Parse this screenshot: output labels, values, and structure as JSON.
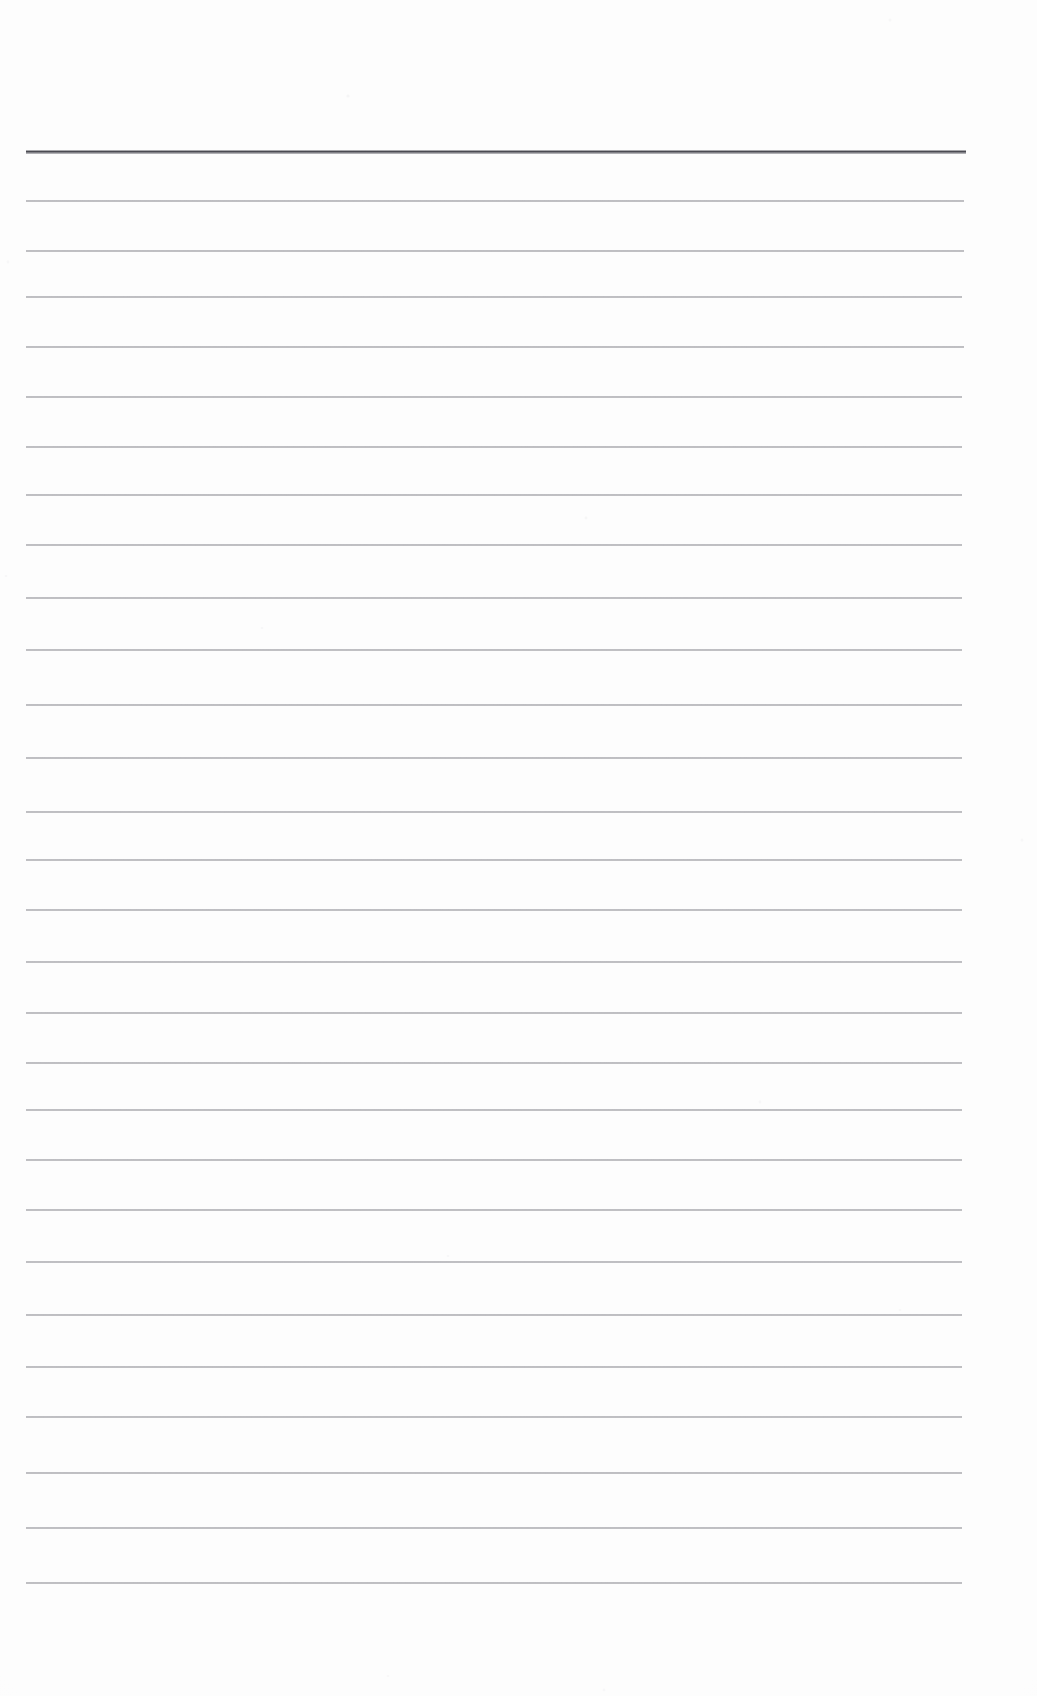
{
  "document": {
    "kind": "scanned-lined-paper",
    "title": "Blank Ruled Notebook Page",
    "page_width": 1037,
    "page_height": 1696,
    "background_color": "#fdfdfd",
    "ink_color": "#6a6a72",
    "header_ink_color": "#3f3f47",
    "text_content": "",
    "ruled_area": {
      "left": 26,
      "right": 964,
      "width": 938,
      "first_line_y": 152,
      "last_line_y": 1583,
      "line_spacing": 53,
      "line_count": 28
    },
    "lines": [
      {
        "index": 1,
        "y": 152,
        "left": 26,
        "right": 966,
        "weight": "header",
        "thickness": 3.2
      },
      {
        "index": 2,
        "y": 201,
        "left": 26,
        "right": 964,
        "weight": "body",
        "thickness": 1.5
      },
      {
        "index": 3,
        "y": 251,
        "left": 26,
        "right": 964,
        "weight": "body",
        "thickness": 1.5
      },
      {
        "index": 4,
        "y": 297,
        "left": 26,
        "right": 962,
        "weight": "body",
        "thickness": 1.5
      },
      {
        "index": 5,
        "y": 347,
        "left": 26,
        "right": 964,
        "weight": "body",
        "thickness": 1.5
      },
      {
        "index": 6,
        "y": 397,
        "left": 26,
        "right": 962,
        "weight": "body",
        "thickness": 1.5
      },
      {
        "index": 7,
        "y": 447,
        "left": 26,
        "right": 962,
        "weight": "body",
        "thickness": 1.5
      },
      {
        "index": 8,
        "y": 495,
        "left": 26,
        "right": 962,
        "weight": "body",
        "thickness": 1.5
      },
      {
        "index": 9,
        "y": 545,
        "left": 26,
        "right": 962,
        "weight": "body",
        "thickness": 1.5
      },
      {
        "index": 10,
        "y": 598,
        "left": 26,
        "right": 962,
        "weight": "body",
        "thickness": 1.5
      },
      {
        "index": 11,
        "y": 650,
        "left": 26,
        "right": 962,
        "weight": "body",
        "thickness": 1.5
      },
      {
        "index": 12,
        "y": 705,
        "left": 26,
        "right": 962,
        "weight": "body",
        "thickness": 1.5
      },
      {
        "index": 13,
        "y": 758,
        "left": 26,
        "right": 962,
        "weight": "body",
        "thickness": 1.5
      },
      {
        "index": 14,
        "y": 812,
        "left": 26,
        "right": 962,
        "weight": "body",
        "thickness": 1.5
      },
      {
        "index": 15,
        "y": 860,
        "left": 26,
        "right": 962,
        "weight": "body",
        "thickness": 1.5
      },
      {
        "index": 16,
        "y": 910,
        "left": 26,
        "right": 962,
        "weight": "body",
        "thickness": 1.5
      },
      {
        "index": 17,
        "y": 962,
        "left": 26,
        "right": 962,
        "weight": "body",
        "thickness": 1.5
      },
      {
        "index": 18,
        "y": 1013,
        "left": 26,
        "right": 962,
        "weight": "body",
        "thickness": 1.5
      },
      {
        "index": 19,
        "y": 1063,
        "left": 26,
        "right": 962,
        "weight": "body",
        "thickness": 1.5
      },
      {
        "index": 20,
        "y": 1110,
        "left": 26,
        "right": 962,
        "weight": "body",
        "thickness": 1.5
      },
      {
        "index": 21,
        "y": 1160,
        "left": 26,
        "right": 962,
        "weight": "body",
        "thickness": 1.5
      },
      {
        "index": 22,
        "y": 1210,
        "left": 26,
        "right": 962,
        "weight": "body",
        "thickness": 1.5
      },
      {
        "index": 23,
        "y": 1262,
        "left": 26,
        "right": 962,
        "weight": "body",
        "thickness": 1.5
      },
      {
        "index": 24,
        "y": 1315,
        "left": 26,
        "right": 962,
        "weight": "body",
        "thickness": 1.5
      },
      {
        "index": 25,
        "y": 1367,
        "left": 26,
        "right": 962,
        "weight": "body",
        "thickness": 1.5
      },
      {
        "index": 26,
        "y": 1417,
        "left": 26,
        "right": 962,
        "weight": "body",
        "thickness": 1.5
      },
      {
        "index": 27,
        "y": 1473,
        "left": 26,
        "right": 962,
        "weight": "body",
        "thickness": 1.5
      },
      {
        "index": 28,
        "y": 1528,
        "left": 26,
        "right": 962,
        "weight": "body",
        "thickness": 1.5
      },
      {
        "index": 29,
        "y": 1583,
        "left": 26,
        "right": 962,
        "weight": "body",
        "thickness": 1.5
      }
    ],
    "speckles": [
      {
        "x": 348,
        "y": 96,
        "r": 1.6,
        "o": 0.16
      },
      {
        "x": 586,
        "y": 518,
        "r": 1.4,
        "o": 0.14
      },
      {
        "x": 262,
        "y": 628,
        "r": 1.3,
        "o": 0.12
      },
      {
        "x": 890,
        "y": 20,
        "r": 1.5,
        "o": 0.13
      },
      {
        "x": 8,
        "y": 262,
        "r": 1.4,
        "o": 0.12
      },
      {
        "x": 6,
        "y": 576,
        "r": 1.3,
        "o": 0.11
      },
      {
        "x": 760,
        "y": 1102,
        "r": 1.4,
        "o": 0.12
      },
      {
        "x": 448,
        "y": 1256,
        "r": 1.3,
        "o": 0.11
      },
      {
        "x": 1022,
        "y": 840,
        "r": 1.5,
        "o": 0.12
      },
      {
        "x": 604,
        "y": 1690,
        "r": 1.4,
        "o": 0.11
      },
      {
        "x": 388,
        "y": 1676,
        "r": 1.3,
        "o": 0.1
      },
      {
        "x": 900,
        "y": 1310,
        "r": 1.3,
        "o": 0.1
      }
    ]
  }
}
